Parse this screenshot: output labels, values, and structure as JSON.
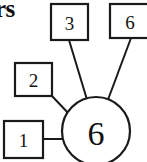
{
  "heading": {
    "text": "rs",
    "note": "clipped bold heading fragment at top-left"
  },
  "diagram": {
    "hub": {
      "label": "6",
      "shape": "circle"
    },
    "nodes": [
      {
        "id": "node-1",
        "label": "1",
        "shape": "rectangle",
        "position": "bottom-left"
      },
      {
        "id": "node-2",
        "label": "2",
        "shape": "rectangle",
        "position": "middle-left"
      },
      {
        "id": "node-3",
        "label": "3",
        "shape": "rectangle",
        "position": "top-center"
      },
      {
        "id": "node-6",
        "label": "6",
        "shape": "rectangle",
        "position": "top-right"
      }
    ],
    "edges": [
      {
        "from": "node-1",
        "to": "hub"
      },
      {
        "from": "node-2",
        "to": "hub"
      },
      {
        "from": "node-3",
        "to": "hub"
      },
      {
        "from": "node-6",
        "to": "hub"
      }
    ],
    "colors": {
      "stroke": "#1a1a1a",
      "fill": "#ffffff",
      "text": "#111111"
    }
  }
}
